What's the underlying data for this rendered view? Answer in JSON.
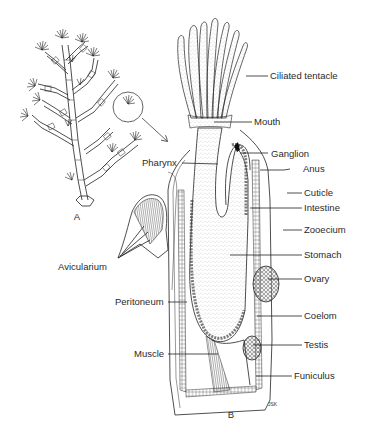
{
  "figure": {
    "panels": [
      {
        "id": "A",
        "label": "A",
        "description": "Bryozoan colony"
      },
      {
        "id": "B",
        "label": "B",
        "description": "Single zooid, longitudinal section"
      }
    ],
    "labels": {
      "ciliated_tentacle": "Ciliated tentacle",
      "mouth": "Mouth",
      "pharynx": "Pharynx",
      "ganglion": "Ganglion",
      "anus": "Anus",
      "cuticle": "Cuticle",
      "intestine": "Intestine",
      "zooecium": "Zooecium",
      "avicularium": "Avicularium",
      "stomach": "Stomach",
      "ovary": "Ovary",
      "peritoneum": "Peritoneum",
      "coelom": "Coelom",
      "testis": "Testis",
      "muscle": "Muscle",
      "funiculus": "Funiculus"
    },
    "signature": "JSK"
  }
}
